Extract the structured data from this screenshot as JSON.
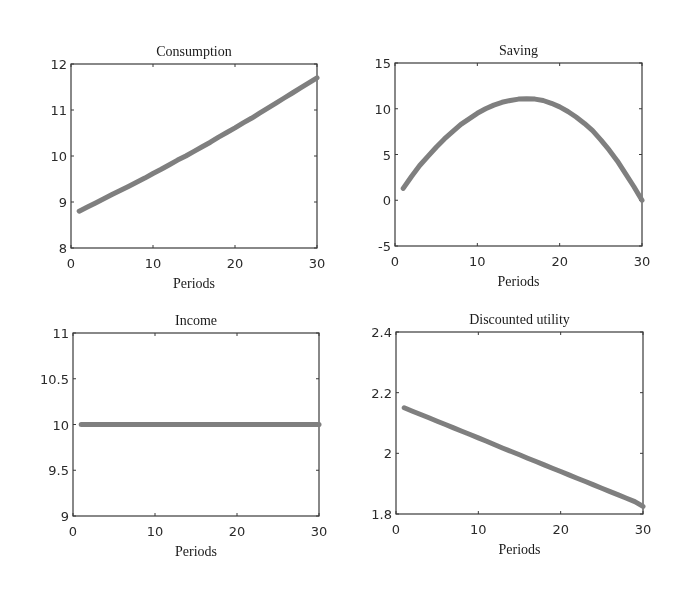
{
  "chart_data": [
    {
      "type": "line",
      "title": "Consumption",
      "xlabel": "Periods",
      "ylabel": "",
      "xlim": [
        0,
        30
      ],
      "ylim": [
        8,
        12
      ],
      "xticks": [
        0,
        10,
        20,
        30
      ],
      "yticks": [
        8,
        9,
        10,
        11,
        12
      ],
      "grid": false,
      "x": [
        1,
        2,
        3,
        4,
        5,
        6,
        7,
        8,
        9,
        10,
        11,
        12,
        13,
        14,
        15,
        16,
        17,
        18,
        19,
        20,
        21,
        22,
        23,
        24,
        25,
        26,
        27,
        28,
        29,
        30
      ],
      "series": [
        {
          "name": "Consumption",
          "color": "#7f7f7f",
          "values": [
            8.8,
            8.89,
            8.98,
            9.07,
            9.16,
            9.25,
            9.34,
            9.43,
            9.52,
            9.62,
            9.71,
            9.81,
            9.91,
            10.0,
            10.1,
            10.2,
            10.3,
            10.41,
            10.51,
            10.61,
            10.72,
            10.82,
            10.93,
            11.04,
            11.15,
            11.26,
            11.37,
            11.48,
            11.59,
            11.7
          ]
        }
      ]
    },
    {
      "type": "line",
      "title": "Saving",
      "xlabel": "Periods",
      "ylabel": "",
      "xlim": [
        0,
        30
      ],
      "ylim": [
        -5,
        15
      ],
      "xticks": [
        0,
        10,
        20,
        30
      ],
      "yticks": [
        -5,
        0,
        5,
        10,
        15
      ],
      "grid": false,
      "x": [
        1,
        2,
        3,
        4,
        5,
        6,
        7,
        8,
        9,
        10,
        11,
        12,
        13,
        14,
        15,
        16,
        17,
        18,
        19,
        20,
        21,
        22,
        23,
        24,
        25,
        26,
        27,
        28,
        29,
        30
      ],
      "series": [
        {
          "name": "Saving",
          "color": "#7f7f7f",
          "values": [
            1.3,
            2.6,
            3.8,
            4.8,
            5.8,
            6.7,
            7.5,
            8.3,
            8.9,
            9.5,
            10.0,
            10.4,
            10.7,
            10.9,
            11.05,
            11.1,
            11.05,
            10.9,
            10.6,
            10.2,
            9.7,
            9.1,
            8.4,
            7.6,
            6.6,
            5.5,
            4.3,
            2.9,
            1.5,
            0.0
          ]
        }
      ]
    },
    {
      "type": "line",
      "title": "Income",
      "xlabel": "Periods",
      "ylabel": "",
      "xlim": [
        0,
        30
      ],
      "ylim": [
        9,
        11
      ],
      "xticks": [
        0,
        10,
        20,
        30
      ],
      "yticks": [
        9,
        9.5,
        10,
        10.5,
        11
      ],
      "grid": false,
      "x": [
        1,
        2,
        3,
        4,
        5,
        6,
        7,
        8,
        9,
        10,
        11,
        12,
        13,
        14,
        15,
        16,
        17,
        18,
        19,
        20,
        21,
        22,
        23,
        24,
        25,
        26,
        27,
        28,
        29,
        30
      ],
      "series": [
        {
          "name": "Income",
          "color": "#7f7f7f",
          "values": [
            10,
            10,
            10,
            10,
            10,
            10,
            10,
            10,
            10,
            10,
            10,
            10,
            10,
            10,
            10,
            10,
            10,
            10,
            10,
            10,
            10,
            10,
            10,
            10,
            10,
            10,
            10,
            10,
            10,
            10
          ]
        }
      ]
    },
    {
      "type": "line",
      "title": "Discounted utility",
      "xlabel": "Periods",
      "ylabel": "",
      "xlim": [
        0,
        30
      ],
      "ylim": [
        1.8,
        2.4
      ],
      "xticks": [
        0,
        10,
        20,
        30
      ],
      "yticks": [
        1.8,
        2,
        2.2,
        2.4
      ],
      "grid": false,
      "x": [
        1,
        2,
        3,
        4,
        5,
        6,
        7,
        8,
        9,
        10,
        11,
        12,
        13,
        14,
        15,
        16,
        17,
        18,
        19,
        20,
        21,
        22,
        23,
        24,
        25,
        26,
        27,
        28,
        29,
        30
      ],
      "series": [
        {
          "name": "Discounted utility",
          "color": "#7f7f7f",
          "values": [
            2.15,
            2.139,
            2.128,
            2.117,
            2.106,
            2.095,
            2.084,
            2.073,
            2.062,
            2.051,
            2.04,
            2.028,
            2.017,
            2.006,
            1.995,
            1.984,
            1.973,
            1.962,
            1.951,
            1.94,
            1.929,
            1.918,
            1.907,
            1.896,
            1.885,
            1.874,
            1.863,
            1.852,
            1.841,
            1.825
          ]
        }
      ]
    }
  ],
  "panels": [
    {
      "title": "Consumption",
      "xlabel": "Periods",
      "ytick_labels": [
        "8",
        "9",
        "10",
        "11",
        "12"
      ],
      "xtick_labels": [
        "0",
        "10",
        "20",
        "30"
      ]
    },
    {
      "title": "Saving",
      "xlabel": "Periods",
      "ytick_labels": [
        "-5",
        "0",
        "5",
        "10",
        "15"
      ],
      "xtick_labels": [
        "0",
        "10",
        "20",
        "30"
      ]
    },
    {
      "title": "Income",
      "xlabel": "Periods",
      "ytick_labels": [
        "9",
        "9.5",
        "10",
        "10.5",
        "11"
      ],
      "xtick_labels": [
        "0",
        "10",
        "20",
        "30"
      ]
    },
    {
      "title": "Discounted utility",
      "xlabel": "Periods",
      "ytick_labels": [
        "1.8",
        "2",
        "2.2",
        "2.4"
      ],
      "xtick_labels": [
        "0",
        "10",
        "20",
        "30"
      ]
    }
  ]
}
